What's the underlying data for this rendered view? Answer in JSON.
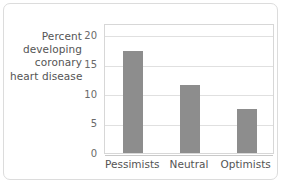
{
  "chart_data": {
    "type": "bar",
    "title": "",
    "subtitle": "",
    "categories": [
      "Pessimists",
      "Neutral",
      "Optimists"
    ],
    "values": [
      17.2,
      11.5,
      7.5
    ],
    "series": [
      {
        "name": "Percent developing coronary heart disease",
        "values": [
          17.2,
          11.5,
          7.5
        ]
      }
    ],
    "xlabel": "",
    "ylabel": "Percent developing coronary heart disease",
    "ylabel_lines": [
      "Percent",
      "developing",
      "coronary",
      "heart disease"
    ],
    "ylim": [
      0,
      22
    ],
    "yticks": [
      0,
      5,
      10,
      15,
      20
    ],
    "ytick_labels": [
      "0",
      "5",
      "10",
      "15",
      "20"
    ],
    "grid": true,
    "grid_axis": "y",
    "legend": false,
    "legend_position": "none",
    "bar_color": "#8d8d8d",
    "grid_color": "#e0e0e0",
    "axis_color": "#d7d7d7",
    "text_color": "#545454",
    "background_color": "#ffffff",
    "frame_color": "#dcdcdc"
  }
}
